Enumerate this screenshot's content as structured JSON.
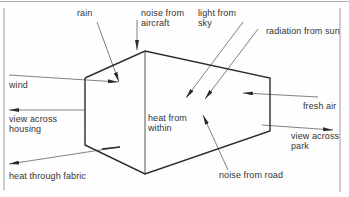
{
  "diagram": {
    "type": "environmental-influences-on-building",
    "center_label": "heat from\nwithin",
    "influences": [
      {
        "id": "rain",
        "label": "rain",
        "direction": "in"
      },
      {
        "id": "noise-aircraft",
        "label": "noise from\naircraft",
        "direction": "in"
      },
      {
        "id": "light-sky",
        "label": "light from\nsky",
        "direction": "in"
      },
      {
        "id": "radiation-sun",
        "label": "radiation from sun",
        "direction": "in"
      },
      {
        "id": "wind",
        "label": "wind",
        "direction": "in"
      },
      {
        "id": "fresh-air",
        "label": "fresh air",
        "direction": "in"
      },
      {
        "id": "view-housing",
        "label": "view across\nhousing",
        "direction": "out"
      },
      {
        "id": "view-park",
        "label": "view across\npark",
        "direction": "out"
      },
      {
        "id": "heat-fabric",
        "label": "heat through fabric",
        "direction": "out"
      },
      {
        "id": "noise-road",
        "label": "noise from road",
        "direction": "in"
      }
    ]
  },
  "colors": {
    "line": "#2b2b2b",
    "text": "#333333",
    "frame": "#9a9a9a"
  }
}
